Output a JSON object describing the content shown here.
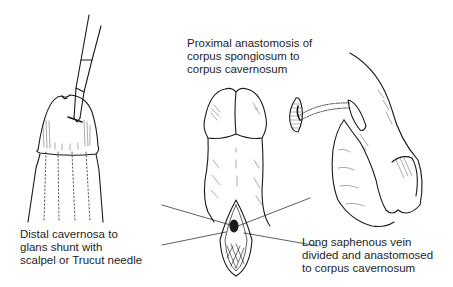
{
  "figure": {
    "panels": [
      {
        "id": "distal-shunt",
        "label_lines": [
          "Distal cavernosa to",
          "glans shunt with",
          "scalpel or Trucut needle"
        ]
      },
      {
        "id": "proximal-anastomosis",
        "label_lines": [
          "Proximal anastomosis of",
          "corpus spongiosum to",
          "corpus cavernosum"
        ]
      },
      {
        "id": "saphenous-vein-shunt",
        "label_lines": [
          "Long saphenous vein",
          "divided and anastomosed",
          "to corpus cavernosum"
        ]
      }
    ]
  }
}
